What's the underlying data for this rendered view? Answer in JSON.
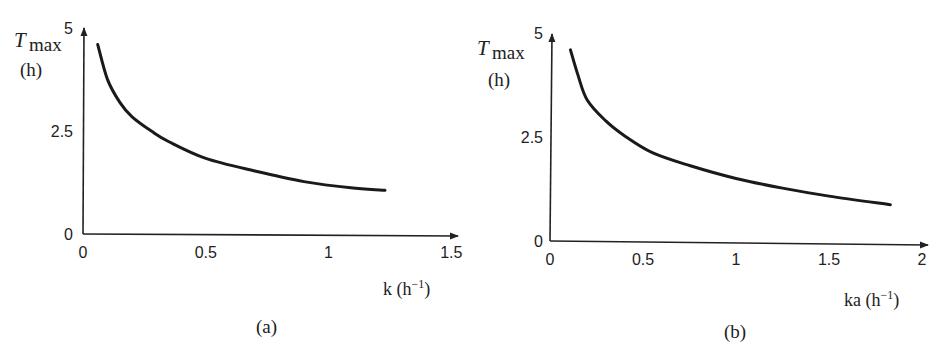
{
  "chart_data": [
    {
      "type": "line",
      "panel_label": "(a)",
      "title": "",
      "xlabel": "k (h⁻¹)",
      "xlabel_main": "k (h",
      "xlabel_sup": "−1",
      "xlabel_close": ")",
      "ylabel_main": "T",
      "ylabel_sub": "max",
      "ylabel_unit": "(h)",
      "xlim": [
        0,
        1.5
      ],
      "ylim": [
        0,
        5
      ],
      "x_ticks": [
        "0",
        "0.5",
        "1",
        "1.5"
      ],
      "y_ticks": [
        "0",
        "2.5",
        "5"
      ],
      "grid": false,
      "legend": "none",
      "series": [
        {
          "name": "Tmax vs k",
          "x": [
            0.06,
            0.1,
            0.15,
            0.2,
            0.28,
            0.35,
            0.5,
            0.7,
            0.9,
            1.1,
            1.23
          ],
          "values": [
            4.6,
            3.75,
            3.2,
            2.85,
            2.5,
            2.25,
            1.85,
            1.55,
            1.3,
            1.15,
            1.1
          ]
        }
      ]
    },
    {
      "type": "line",
      "panel_label": "(b)",
      "title": "",
      "xlabel": "ka (h⁻¹)",
      "xlabel_main": "ka (h",
      "xlabel_sup": "−1",
      "xlabel_close": ")",
      "ylabel_main": "T",
      "ylabel_sub": "max",
      "ylabel_unit": "(h)",
      "xlim": [
        0,
        2
      ],
      "ylim": [
        0,
        5
      ],
      "x_ticks": [
        "0",
        "0.5",
        "1",
        "1.5",
        "2"
      ],
      "y_ticks": [
        "0",
        "2.5",
        "5"
      ],
      "grid": false,
      "legend": "none",
      "series": [
        {
          "name": "Tmax vs ka",
          "x": [
            0.11,
            0.15,
            0.2,
            0.3,
            0.4,
            0.55,
            0.75,
            1.0,
            1.25,
            1.5,
            1.83
          ],
          "values": [
            4.6,
            4.0,
            3.4,
            2.9,
            2.55,
            2.15,
            1.85,
            1.55,
            1.33,
            1.15,
            0.96
          ]
        }
      ]
    }
  ]
}
